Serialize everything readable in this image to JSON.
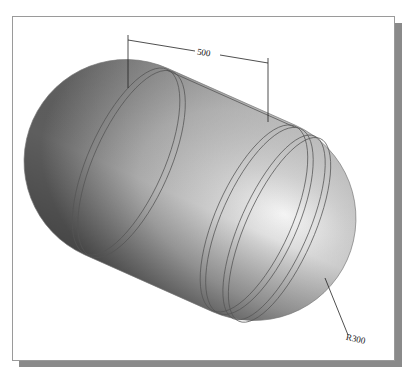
{
  "figure": {
    "background_color": "#ffffff",
    "frame_border_color": "#9a9a9a",
    "frame_shadow_color": "#8a8a8a",
    "body_color_light": "#f4f4f4",
    "body_color_mid": "#b8b8b8",
    "body_color_dark": "#6a6a6a",
    "edge_line_color": "#555555"
  },
  "dimensions": {
    "length_label": "500",
    "radius_label": "R300"
  }
}
